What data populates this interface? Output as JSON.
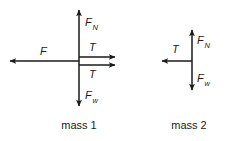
{
  "figure": {
    "type": "free-body-diagram",
    "background_color": "#ffffff",
    "stroke_color": "#1a1a1a",
    "text_color": "#1a1a1a"
  },
  "mass1": {
    "caption": "mass 1",
    "forces": {
      "normal": {
        "symbol": "F",
        "subscript": "N",
        "direction": "up"
      },
      "weight": {
        "symbol": "F",
        "subscript": "w",
        "direction": "down"
      },
      "applied": {
        "symbol": "F",
        "subscript": "",
        "direction": "left"
      },
      "tension_upper": {
        "symbol": "T",
        "subscript": "",
        "direction": "right"
      },
      "tension_lower": {
        "symbol": "T",
        "subscript": "",
        "direction": "right"
      }
    }
  },
  "mass2": {
    "caption": "mass 2",
    "forces": {
      "normal": {
        "symbol": "F",
        "subscript": "N",
        "direction": "up"
      },
      "weight": {
        "symbol": "F",
        "subscript": "w",
        "direction": "down"
      },
      "tension": {
        "symbol": "T",
        "subscript": "",
        "direction": "left"
      }
    }
  }
}
